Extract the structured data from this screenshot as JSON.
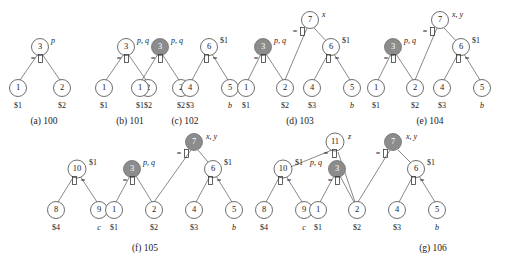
{
  "figure": {
    "colors": {
      "node_fill": "#ffffff",
      "node_stroke": "#4a4a4a",
      "shaded_node_fill": "#8c8c8c",
      "shaded_node_text": "#ffffff",
      "edge": "#6b6b6b",
      "text": "#1a1a1a",
      "background": "#ffffff"
    },
    "glyphs": {
      "equals": "=",
      "box": "[]",
      "op_eq_box": "=[]",
      "op_box_eq": "[]="
    },
    "panels": [
      {
        "id": "a",
        "caption": "(a) 100",
        "nodes": [
          {
            "name": "3",
            "shaded": false,
            "side_label": "p",
            "side_label_italic": true,
            "op": "=[]"
          },
          {
            "name": "1",
            "shaded": false,
            "leaf_label": "$1",
            "leaf_label_italic": false
          },
          {
            "name": "2",
            "shaded": false,
            "leaf_label": "$2",
            "leaf_label_italic": false
          }
        ]
      },
      {
        "id": "b",
        "caption": "(b) 101",
        "nodes": [
          {
            "name": "3",
            "shaded": false,
            "side_label": "p, q",
            "side_label_italic": true,
            "op": "=[]"
          },
          {
            "name": "1",
            "shaded": false,
            "leaf_label": "$1",
            "leaf_label_italic": false
          },
          {
            "name": "2",
            "shaded": false,
            "leaf_label": "$2",
            "leaf_label_italic": false
          }
        ]
      },
      {
        "id": "c",
        "caption": "(c) 102",
        "nodes": [
          {
            "name": "3",
            "shaded": true,
            "side_label": "p, q",
            "side_label_italic": true,
            "op": "=[]"
          },
          {
            "name": "1",
            "shaded": false,
            "leaf_label": "$1",
            "leaf_label_italic": false
          },
          {
            "name": "2",
            "shaded": false,
            "leaf_label": "$2",
            "leaf_label_italic": false
          },
          {
            "name": "6",
            "shaded": false,
            "side_label": "$1",
            "side_label_italic": false,
            "op": "[]="
          },
          {
            "name": "4",
            "shaded": false,
            "leaf_label": "$3",
            "leaf_label_italic": false
          },
          {
            "name": "5",
            "shaded": false,
            "leaf_label": "b",
            "leaf_label_italic": true
          }
        ]
      },
      {
        "id": "d",
        "caption": "(d) 103",
        "nodes": [
          {
            "name": "7",
            "shaded": false,
            "side_label": "x",
            "side_label_italic": true,
            "op": "=[]"
          },
          {
            "name": "3",
            "shaded": true,
            "side_label": "p, q",
            "side_label_italic": true,
            "op": "=[]"
          },
          {
            "name": "1",
            "shaded": false,
            "leaf_label": "$1",
            "leaf_label_italic": false
          },
          {
            "name": "2",
            "shaded": false,
            "leaf_label": "$2",
            "leaf_label_italic": false
          },
          {
            "name": "6",
            "shaded": false,
            "side_label": "$1",
            "side_label_italic": false,
            "op": "[]="
          },
          {
            "name": "4",
            "shaded": false,
            "leaf_label": "$3",
            "leaf_label_italic": false
          },
          {
            "name": "5",
            "shaded": false,
            "leaf_label": "b",
            "leaf_label_italic": true
          }
        ]
      },
      {
        "id": "e",
        "caption": "(e) 104",
        "nodes": [
          {
            "name": "7",
            "shaded": false,
            "side_label": "x, y",
            "side_label_italic": true,
            "op": "=[]"
          },
          {
            "name": "3",
            "shaded": true,
            "side_label": "p, q",
            "side_label_italic": true,
            "op": "=[]"
          },
          {
            "name": "1",
            "shaded": false,
            "leaf_label": "$1",
            "leaf_label_italic": false
          },
          {
            "name": "2",
            "shaded": false,
            "leaf_label": "$2",
            "leaf_label_italic": false
          },
          {
            "name": "6",
            "shaded": false,
            "side_label": "$1",
            "side_label_italic": false,
            "op": "[]="
          },
          {
            "name": "4",
            "shaded": false,
            "leaf_label": "$3",
            "leaf_label_italic": false
          },
          {
            "name": "5",
            "shaded": false,
            "leaf_label": "b",
            "leaf_label_italic": true
          }
        ]
      },
      {
        "id": "f",
        "caption": "(f) 105",
        "nodes": [
          {
            "name": "10",
            "shaded": false,
            "side_label": "$1",
            "side_label_italic": false,
            "op": "[]="
          },
          {
            "name": "8",
            "shaded": false,
            "leaf_label": "$4",
            "leaf_label_italic": false
          },
          {
            "name": "9",
            "shaded": false,
            "leaf_label": "c",
            "leaf_label_italic": true
          },
          {
            "name": "7",
            "shaded": true,
            "side_label": "x, y",
            "side_label_italic": true,
            "op": "=[]"
          },
          {
            "name": "3",
            "shaded": true,
            "side_label": "p, q",
            "side_label_italic": true,
            "op": "=[]"
          },
          {
            "name": "1",
            "shaded": false,
            "leaf_label": "$1",
            "leaf_label_italic": false
          },
          {
            "name": "2",
            "shaded": false,
            "leaf_label": "$2",
            "leaf_label_italic": false
          },
          {
            "name": "6",
            "shaded": false,
            "side_label": "$1",
            "side_label_italic": false,
            "op": "[]="
          },
          {
            "name": "4",
            "shaded": false,
            "leaf_label": "$3",
            "leaf_label_italic": false
          },
          {
            "name": "5",
            "shaded": false,
            "leaf_label": "b",
            "leaf_label_italic": true
          }
        ]
      },
      {
        "id": "g",
        "caption": "(g) 106",
        "nodes": [
          {
            "name": "11",
            "shaded": false,
            "side_label": "z",
            "side_label_italic": true,
            "op": "=[]"
          },
          {
            "name": "10",
            "shaded": false,
            "side_label": "$1",
            "side_label_italic": false,
            "op": "[]="
          },
          {
            "name": "8",
            "shaded": false,
            "leaf_label": "$4",
            "leaf_label_italic": false
          },
          {
            "name": "9",
            "shaded": false,
            "leaf_label": "c",
            "leaf_label_italic": true
          },
          {
            "name": "7",
            "shaded": true,
            "side_label": "x, y",
            "side_label_italic": true,
            "op": "=[]"
          },
          {
            "name": "3",
            "shaded": true,
            "side_label": "p, q",
            "side_label_italic": true,
            "op": "=[]"
          },
          {
            "name": "1",
            "shaded": false,
            "leaf_label": "$1",
            "leaf_label_italic": false
          },
          {
            "name": "2",
            "shaded": false,
            "leaf_label": "$2",
            "leaf_label_italic": false
          },
          {
            "name": "6",
            "shaded": false,
            "side_label": "$1",
            "side_label_italic": false,
            "op": "[]="
          },
          {
            "name": "4",
            "shaded": false,
            "leaf_label": "$3",
            "leaf_label_italic": false
          },
          {
            "name": "5",
            "shaded": false,
            "leaf_label": "b",
            "leaf_label_italic": true
          }
        ]
      }
    ]
  }
}
